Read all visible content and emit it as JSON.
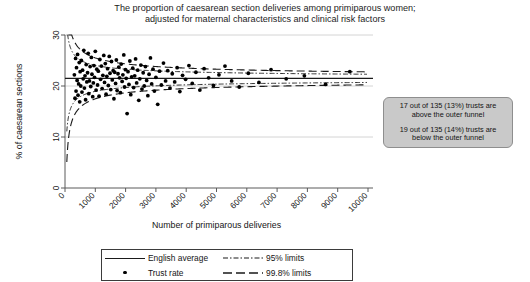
{
  "title": {
    "line1": "The proportion of caesarean section deliveries among primiparous women;",
    "line2": "adjusted for maternal characteristics and clinical risk factors"
  },
  "annotation": {
    "paragraph1_line1": "17 out of 135 (13%) trusts are",
    "paragraph1_line2": "above the outer funnel",
    "paragraph2_line1": "19 out of 135 (14%) trusts are",
    "paragraph2_line2": "below the outer funnel",
    "fill_color": "#c9c9c9",
    "border_color": "#8e8e8e"
  },
  "legend": {
    "items": [
      {
        "key": "solid-line",
        "label": "English average"
      },
      {
        "key": "dash-dot-line",
        "label": "95% limits"
      },
      {
        "key": "dot-marker",
        "label": "Trust rate"
      },
      {
        "key": "dashed-line",
        "label": "99.8% limits"
      }
    ]
  },
  "chart_data": {
    "type": "scatter",
    "title": "The proportion of caesarean section deliveries among primiparous women; adjusted for maternal characteristics and clinical risk factors",
    "xlabel": "Number of primiparous deliveries",
    "ylabel": "% of caesarean sections",
    "xlim": [
      0,
      10000
    ],
    "ylim": [
      0,
      30
    ],
    "xticks": [
      0,
      1000,
      2000,
      3000,
      4000,
      5000,
      6000,
      7000,
      8000,
      9000,
      10000
    ],
    "xtick_labels": [
      "0",
      "1000",
      "2000",
      "3000",
      "4000",
      "5000",
      "6000",
      "7000",
      "8000",
      "9000",
      "10000"
    ],
    "yticks": [
      0,
      10,
      20,
      30
    ],
    "ytick_labels": [
      "0",
      "10",
      "20",
      "30"
    ],
    "grid": "horizontal-light",
    "legend_position": "below-axes",
    "center_line": {
      "name": "English average",
      "value": 21.5,
      "style": "solid"
    },
    "limits": [
      {
        "name": "95% limits",
        "style": "dash-dot",
        "sigma": 1.96
      },
      {
        "name": "99.8% limits",
        "style": "dashed",
        "sigma": 3.09
      }
    ],
    "n_trusts": 135,
    "n_above_outer_funnel": 17,
    "pct_above_outer_funnel": 13,
    "n_below_outer_funnel": 19,
    "pct_below_outer_funnel": 14,
    "series": [
      {
        "name": "Trust rate",
        "marker": "filled-circle",
        "color": "#000000",
        "points": [
          [
            310,
            22.2
          ],
          [
            330,
            17.6
          ],
          [
            350,
            25.4
          ],
          [
            365,
            19.0
          ],
          [
            380,
            23.6
          ],
          [
            400,
            21.1
          ],
          [
            415,
            26.2
          ],
          [
            430,
            18.2
          ],
          [
            450,
            20.4
          ],
          [
            470,
            24.6
          ],
          [
            485,
            16.9
          ],
          [
            500,
            22.8
          ],
          [
            520,
            20.0
          ],
          [
            540,
            25.0
          ],
          [
            560,
            18.8
          ],
          [
            580,
            23.1
          ],
          [
            600,
            21.4
          ],
          [
            620,
            27.0
          ],
          [
            640,
            19.6
          ],
          [
            660,
            22.0
          ],
          [
            680,
            17.3
          ],
          [
            700,
            24.2
          ],
          [
            720,
            20.8
          ],
          [
            745,
            22.6
          ],
          [
            765,
            26.4
          ],
          [
            785,
            18.5
          ],
          [
            805,
            21.0
          ],
          [
            830,
            23.8
          ],
          [
            850,
            19.9
          ],
          [
            870,
            25.6
          ],
          [
            890,
            22.3
          ],
          [
            915,
            17.9
          ],
          [
            935,
            20.6
          ],
          [
            955,
            24.0
          ],
          [
            975,
            21.7
          ],
          [
            1000,
            26.8
          ],
          [
            1025,
            19.2
          ],
          [
            1050,
            23.3
          ],
          [
            1075,
            20.2
          ],
          [
            1100,
            22.9
          ],
          [
            1125,
            18.0
          ],
          [
            1150,
            25.2
          ],
          [
            1175,
            21.3
          ],
          [
            1200,
            23.9
          ],
          [
            1225,
            19.5
          ],
          [
            1250,
            22.1
          ],
          [
            1280,
            26.0
          ],
          [
            1305,
            20.7
          ],
          [
            1330,
            24.4
          ],
          [
            1355,
            18.4
          ],
          [
            1380,
            21.9
          ],
          [
            1405,
            23.4
          ],
          [
            1430,
            20.1
          ],
          [
            1460,
            25.8
          ],
          [
            1485,
            22.5
          ],
          [
            1510,
            19.3
          ],
          [
            1535,
            24.8
          ],
          [
            1560,
            21.2
          ],
          [
            1590,
            23.0
          ],
          [
            1615,
            17.5
          ],
          [
            1640,
            22.7
          ],
          [
            1670,
            20.5
          ],
          [
            1695,
            25.1
          ],
          [
            1720,
            19.1
          ],
          [
            1750,
            22.4
          ],
          [
            1775,
            23.7
          ],
          [
            1800,
            21.6
          ],
          [
            1830,
            18.7
          ],
          [
            1855,
            24.3
          ],
          [
            1885,
            20.9
          ],
          [
            1910,
            22.2
          ],
          [
            1940,
            26.1
          ],
          [
            1965,
            19.8
          ],
          [
            1995,
            23.2
          ],
          [
            2020,
            21.5
          ],
          [
            2050,
            14.6
          ],
          [
            2080,
            22.8
          ],
          [
            2110,
            20.3
          ],
          [
            2140,
            24.9
          ],
          [
            2170,
            18.3
          ],
          [
            2200,
            21.8
          ],
          [
            2235,
            23.5
          ],
          [
            2265,
            19.7
          ],
          [
            2300,
            22.0
          ],
          [
            2330,
            25.3
          ],
          [
            2365,
            20.6
          ],
          [
            2400,
            23.1
          ],
          [
            2435,
            17.2
          ],
          [
            2470,
            21.4
          ],
          [
            2505,
            24.1
          ],
          [
            2540,
            19.4
          ],
          [
            2580,
            22.6
          ],
          [
            2615,
            20.0
          ],
          [
            2655,
            23.8
          ],
          [
            2695,
            21.1
          ],
          [
            2735,
            18.1
          ],
          [
            2775,
            22.3
          ],
          [
            2820,
            25.5
          ],
          [
            2860,
            20.4
          ],
          [
            2905,
            23.3
          ],
          [
            2950,
            19.0
          ],
          [
            3000,
            21.7
          ],
          [
            3060,
            16.4
          ],
          [
            3120,
            22.9
          ],
          [
            3180,
            20.2
          ],
          [
            3250,
            24.5
          ],
          [
            3320,
            21.0
          ],
          [
            3390,
            23.0
          ],
          [
            3465,
            19.6
          ],
          [
            3540,
            22.4
          ],
          [
            3620,
            20.8
          ],
          [
            3700,
            23.6
          ],
          [
            3790,
            18.9
          ],
          [
            3880,
            22.1
          ],
          [
            3980,
            21.3
          ],
          [
            4090,
            24.0
          ],
          [
            4200,
            20.5
          ],
          [
            4320,
            22.7
          ],
          [
            4450,
            19.2
          ],
          [
            4590,
            23.4
          ],
          [
            4740,
            21.6
          ],
          [
            4900,
            20.1
          ],
          [
            5080,
            22.2
          ],
          [
            5280,
            23.9
          ],
          [
            5500,
            21.0
          ],
          [
            5750,
            19.8
          ],
          [
            6050,
            22.5
          ],
          [
            6400,
            20.7
          ],
          [
            6800,
            23.2
          ],
          [
            7300,
            21.4
          ],
          [
            7900,
            22.0
          ],
          [
            8600,
            20.3
          ],
          [
            9400,
            22.8
          ]
        ]
      }
    ]
  }
}
